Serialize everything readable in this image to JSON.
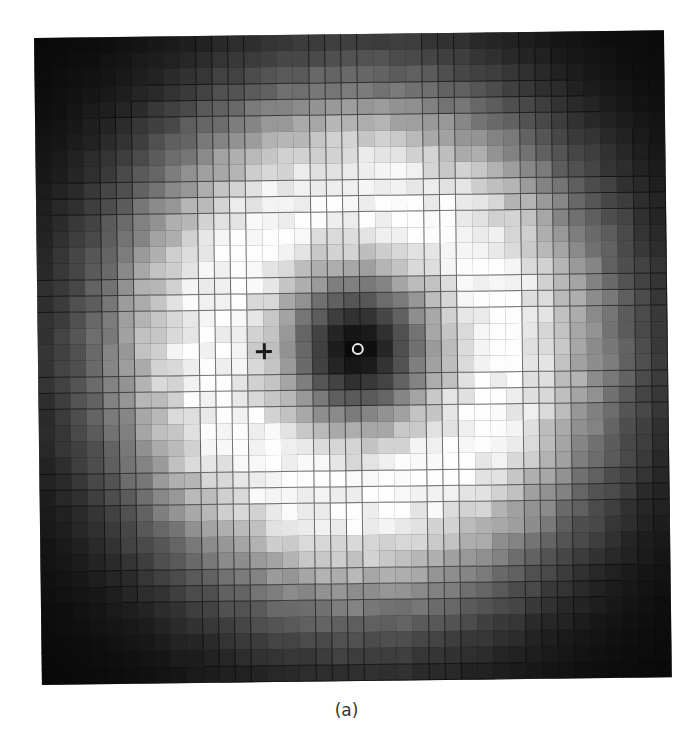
{
  "caption": "(a)",
  "chart_data": {
    "type": "heatmap",
    "title": "",
    "subtitle": "",
    "xlabel": "",
    "ylabel": "",
    "grid": true,
    "legend": null,
    "colormap": "grayscale",
    "cols": 39,
    "rows": 40,
    "cell_width_px": 16.15,
    "cell_height_px": 16.17,
    "center_px": [
      320,
      315
    ],
    "ring_radius_px": 146,
    "beam_waist_px": 206,
    "ellipticity": 0.97,
    "noise": 0.08,
    "markers": [
      {
        "type": "circle",
        "label": "beam-center",
        "x_px": 320,
        "y_px": 315,
        "color": "#e8e8e8"
      },
      {
        "type": "cross",
        "label": "reference-point",
        "x_px": 226,
        "y_px": 316,
        "color": "#1a1a1a"
      }
    ],
    "intensity_range": [
      0,
      1
    ]
  }
}
